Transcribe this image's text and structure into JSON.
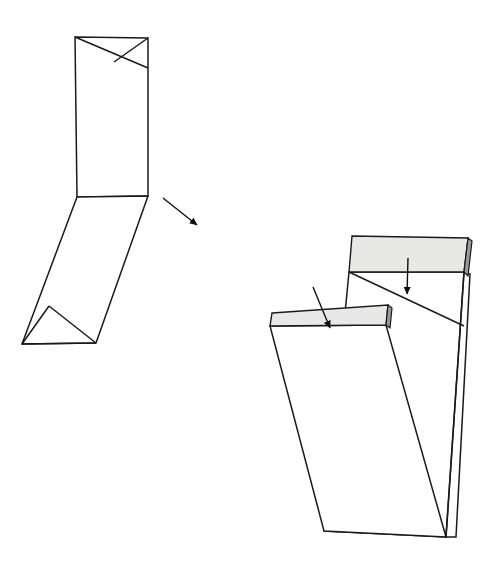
{
  "figure": {
    "title": "",
    "background_color": "#ffffff",
    "stroke_color": "#1a1a1a",
    "flap_fill_color": "#e8e8e6",
    "flap_edge_fill_color": "#9a9a98",
    "panel_fill_color": "#ffffff",
    "canvas": {
      "width": 494,
      "height": 566
    },
    "views": [
      {
        "name": "folded-view",
        "label": "",
        "description": "Folded closed state with crossed gusset folds at top and bottom",
        "parts": [
          {
            "name": "front-panel",
            "label": "",
            "points": "75,37 148,38 148,196 77,197"
          },
          {
            "name": "top-gusset-fold-left",
            "label": "",
            "points": "75,37 148,68"
          },
          {
            "name": "top-gusset-fold-right",
            "label": "",
            "points": "148,38 114,62"
          },
          {
            "name": "lower-panel",
            "label": "",
            "points": "77,197 148,196 96,343 22,344"
          },
          {
            "name": "bottom-gusset-fold-left",
            "label": "",
            "points": "22,344 49,306"
          },
          {
            "name": "bottom-gusset-fold-right",
            "label": "",
            "points": "22,344 96,343"
          },
          {
            "name": "bottom-gusset-crease",
            "label": "",
            "points": "49,306 96,343"
          }
        ],
        "annotations": [
          {
            "name": "direction-arrow",
            "label": "",
            "from": [
              163,
              198
            ],
            "to": [
              197,
              225
            ]
          }
        ]
      },
      {
        "name": "opened-view",
        "label": "",
        "description": "Opened state showing two shaded flaps with insertion arrows",
        "parts": [
          {
            "name": "rear-panel",
            "label": "",
            "points": "349,272 464,272 464,326 446,537 324,531"
          },
          {
            "name": "right-side-panel",
            "label": "",
            "points": "464,272 470,274 456,537 446,537"
          },
          {
            "name": "v-fold-crease-left",
            "label": "",
            "points": "349,272 464,326"
          },
          {
            "name": "v-fold-crease-right",
            "label": "",
            "points": "464,272 446,537"
          },
          {
            "name": "front-panel-open",
            "label": "",
            "points": "270,326 386,325 446,537 324,531"
          },
          {
            "name": "upper-flap",
            "label": "",
            "points": "352,236 468,238 464,272 349,272"
          },
          {
            "name": "upper-flap-thickness",
            "label": "",
            "points": "468,238 472,241 468,276 464,272"
          },
          {
            "name": "lower-flap",
            "label": "",
            "points": "272,313 388,305 386,325 270,326"
          },
          {
            "name": "lower-flap-thickness",
            "label": "",
            "points": "388,305 392,308 390,328 386,325"
          }
        ],
        "annotations": [
          {
            "name": "upper-flap-arrow",
            "label": "",
            "from": [
              408,
              258
            ],
            "to": [
              407,
              294
            ]
          },
          {
            "name": "lower-flap-arrow",
            "label": "",
            "from": [
              313,
              287
            ],
            "to": [
              330,
              328
            ]
          }
        ]
      }
    ]
  }
}
